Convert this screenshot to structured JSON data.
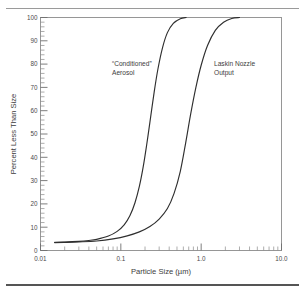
{
  "figure": {
    "name": "particle-size-distribution-figure",
    "background_color": "#ffffff",
    "frame_color": "#8c8c8c",
    "curve_color": "#2f2f2f",
    "text_color": "#4a4a4a"
  },
  "chart_data": {
    "type": "line",
    "title": "",
    "subtitle": "",
    "xlabel": "Particle Size (µm)",
    "ylabel": "Percent Less Than Size",
    "xscale": "log",
    "yscale": "linear",
    "xlim": [
      0.01,
      10.0
    ],
    "ylim": [
      0,
      100
    ],
    "grid": false,
    "legend_position": "inline-annotations",
    "x_major_ticks": [
      0.01,
      0.1,
      1.0,
      10.0
    ],
    "x_major_tick_labels": [
      "0.01",
      "0.1",
      "1.0",
      "10.0"
    ],
    "x_minor_ticks": [
      0.02,
      0.03,
      0.04,
      0.05,
      0.06,
      0.07,
      0.08,
      0.09,
      0.2,
      0.3,
      0.4,
      0.5,
      0.6,
      0.7,
      0.8,
      0.9,
      2,
      3,
      4,
      5,
      6,
      7,
      8,
      9
    ],
    "y_major_ticks": [
      0,
      10,
      20,
      30,
      40,
      50,
      60,
      70,
      80,
      90,
      100
    ],
    "y_major_tick_labels": [
      "0",
      "10",
      "20",
      "30",
      "40",
      "50",
      "60",
      "70",
      "80",
      "90",
      "100"
    ],
    "y_minor_tick_step": 2,
    "series": [
      {
        "name": "“Conditioned” Aerosol",
        "annotation_line1": "“Conditioned”",
        "annotation_line2": "Aerosol",
        "median_um": 0.22,
        "x": [
          0.015,
          0.02,
          0.03,
          0.04,
          0.05,
          0.07,
          0.09,
          0.11,
          0.13,
          0.15,
          0.17,
          0.19,
          0.21,
          0.23,
          0.26,
          0.29,
          0.33,
          0.38,
          0.45,
          0.55,
          0.65
        ],
        "values": [
          3.5,
          3.6,
          3.9,
          4.3,
          4.8,
          6.2,
          8.2,
          11.0,
          15.0,
          20.5,
          27.5,
          36.0,
          45.5,
          55.0,
          68.0,
          78.0,
          87.0,
          93.5,
          97.5,
          99.5,
          100.0
        ]
      },
      {
        "name": "Laskin Nozzle Output",
        "annotation_line1": "Laskin Nozzle",
        "annotation_line2": "Output",
        "median_um": 0.65,
        "x": [
          0.015,
          0.02,
          0.03,
          0.05,
          0.08,
          0.12,
          0.17,
          0.23,
          0.3,
          0.38,
          0.46,
          0.55,
          0.64,
          0.74,
          0.86,
          1.0,
          1.2,
          1.5,
          1.9,
          2.4,
          3.0
        ],
        "values": [
          3.4,
          3.5,
          3.7,
          4.1,
          5.0,
          6.3,
          8.0,
          10.3,
          13.5,
          18.0,
          24.5,
          34.0,
          46.0,
          58.5,
          70.0,
          79.5,
          88.0,
          94.5,
          98.0,
          99.6,
          100.0
        ]
      }
    ]
  }
}
